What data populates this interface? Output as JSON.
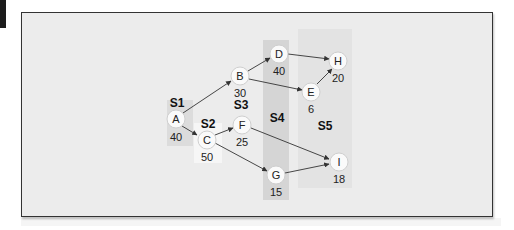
{
  "diagram": {
    "type": "staged-network",
    "colors": {
      "frame_bg": "#ececec",
      "stage_shade_dark": "#d6d6d6",
      "stage_shade_light": "#e2e2e2",
      "stage_shade_white": "#f6f6f6",
      "node_fill": "#fafafa",
      "edge": "#333333"
    },
    "stages": [
      {
        "id": "S1",
        "label": "S1"
      },
      {
        "id": "S2",
        "label": "S2"
      },
      {
        "id": "S3",
        "label": "S3"
      },
      {
        "id": "S4",
        "label": "S4"
      },
      {
        "id": "S5",
        "label": "S5"
      }
    ],
    "nodes": [
      {
        "id": "A",
        "label": "A",
        "value": "40"
      },
      {
        "id": "B",
        "label": "B",
        "value": "30"
      },
      {
        "id": "C",
        "label": "C",
        "value": "50"
      },
      {
        "id": "D",
        "label": "D",
        "value": "40"
      },
      {
        "id": "E",
        "label": "E",
        "value": "6"
      },
      {
        "id": "F",
        "label": "F",
        "value": "25"
      },
      {
        "id": "G",
        "label": "G",
        "value": "15"
      },
      {
        "id": "H",
        "label": "H",
        "value": "20"
      },
      {
        "id": "I",
        "label": "I",
        "value": "18"
      }
    ],
    "edges": [
      {
        "from": "A",
        "to": "B"
      },
      {
        "from": "A",
        "to": "C"
      },
      {
        "from": "B",
        "to": "D"
      },
      {
        "from": "B",
        "to": "E"
      },
      {
        "from": "C",
        "to": "F"
      },
      {
        "from": "C",
        "to": "G"
      },
      {
        "from": "D",
        "to": "H"
      },
      {
        "from": "E",
        "to": "H"
      },
      {
        "from": "F",
        "to": "I"
      },
      {
        "from": "G",
        "to": "I"
      }
    ]
  }
}
